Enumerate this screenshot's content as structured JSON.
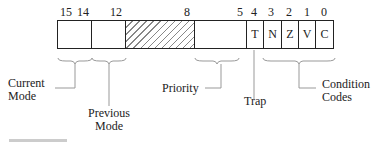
{
  "diagram": {
    "bit_numbers": [
      "15",
      "14",
      "12",
      "8",
      "5",
      "4",
      "3",
      "2",
      "1",
      "0"
    ],
    "cells": [
      {
        "name": "current-mode",
        "text": ""
      },
      {
        "name": "previous-mode",
        "text": ""
      },
      {
        "name": "reserved",
        "text": ""
      },
      {
        "name": "priority",
        "text": ""
      },
      {
        "name": "trap",
        "text": "T"
      },
      {
        "name": "negative",
        "text": "N"
      },
      {
        "name": "zero",
        "text": "Z"
      },
      {
        "name": "overflow",
        "text": "V"
      },
      {
        "name": "carry",
        "text": "C"
      }
    ],
    "labels": {
      "current_mode_1": "Current",
      "current_mode_2": "Mode",
      "previous_mode_1": "Previous",
      "previous_mode_2": "Mode",
      "priority": "Priority",
      "trap": "Trap",
      "condition_codes_1": "Condition",
      "condition_codes_2": "Codes"
    }
  }
}
